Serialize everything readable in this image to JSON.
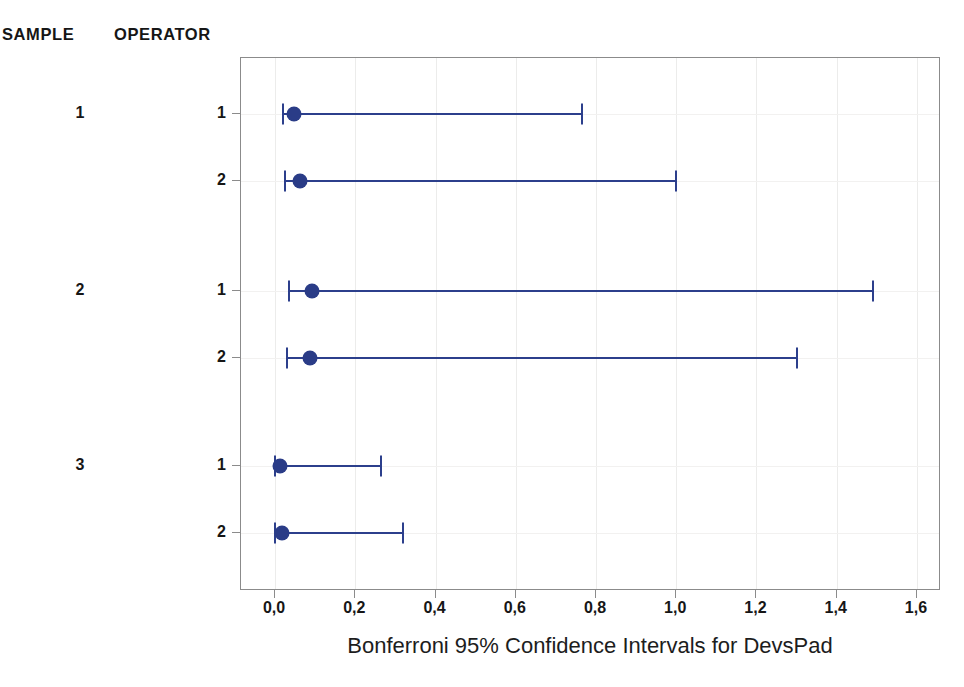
{
  "headers": {
    "sample": "SAMPLE",
    "operator": "OPERATOR"
  },
  "axis_title": "Bonferroni 95% Confidence Intervals for DevsPad",
  "colors": {
    "interval": "#2c3f8c",
    "marker": "#2a3c87",
    "frame": "#8b8b8b",
    "grid": "#ececeb",
    "text": "#161616",
    "background": "#ffffff"
  },
  "xticks": [
    {
      "value": 0.0,
      "label": "0,0"
    },
    {
      "value": 0.2,
      "label": "0,2"
    },
    {
      "value": 0.4,
      "label": "0,4"
    },
    {
      "value": 0.6,
      "label": "0,6"
    },
    {
      "value": 0.8,
      "label": "0,8"
    },
    {
      "value": 1.0,
      "label": "1,0"
    },
    {
      "value": 1.2,
      "label": "1,2"
    },
    {
      "value": 1.4,
      "label": "1,4"
    },
    {
      "value": 1.6,
      "label": "1,6"
    }
  ],
  "sample_labels": [
    "1",
    "2",
    "3"
  ],
  "operator_labels": [
    "1",
    "2",
    "1",
    "2",
    "1",
    "2"
  ],
  "chart_data": {
    "type": "scatter",
    "title": "",
    "subtitle": "",
    "xlabel": "Bonferroni 95% Confidence Intervals for DevsPad",
    "ylabel": "",
    "xlim": [
      -0.085,
      1.66
    ],
    "xticks": [
      0.0,
      0.2,
      0.4,
      0.6,
      0.8,
      1.0,
      1.2,
      1.4,
      1.6
    ],
    "xticklabels": [
      "0,0",
      "0,2",
      "0,4",
      "0,6",
      "0,8",
      "1,0",
      "1,2",
      "1,4",
      "1,6"
    ],
    "grid": true,
    "legend": false,
    "group_headers": [
      "SAMPLE",
      "OPERATOR"
    ],
    "intervals": [
      {
        "sample": "1",
        "operator": "1",
        "lower": 0.02,
        "estimate": 0.046,
        "upper": 0.765
      },
      {
        "sample": "1",
        "operator": "2",
        "lower": 0.025,
        "estimate": 0.063,
        "upper": 1.0
      },
      {
        "sample": "2",
        "operator": "1",
        "lower": 0.035,
        "estimate": 0.093,
        "upper": 1.49
      },
      {
        "sample": "2",
        "operator": "2",
        "lower": 0.03,
        "estimate": 0.086,
        "upper": 1.3
      },
      {
        "sample": "3",
        "operator": "1",
        "lower": 0.0,
        "estimate": 0.011,
        "upper": 0.265
      },
      {
        "sample": "3",
        "operator": "2",
        "lower": 0.0,
        "estimate": 0.016,
        "upper": 0.32
      }
    ]
  }
}
